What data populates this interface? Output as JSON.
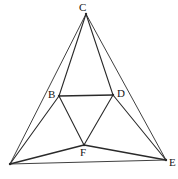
{
  "figure": {
    "type": "geometry-diagram",
    "background_color": "#ffffff",
    "stroke_color": "#2a2a2a",
    "label_color": "#151515",
    "canvas": {
      "width": 178,
      "height": 179
    },
    "points": [
      {
        "id": "A",
        "label": "",
        "x": 10,
        "y": 164,
        "label_x": 4,
        "label_y": 166,
        "faint": true
      },
      {
        "id": "B",
        "label": "B",
        "x": 59,
        "y": 96,
        "label_x": 48,
        "label_y": 89,
        "faint": false
      },
      {
        "id": "C",
        "label": "C",
        "x": 86,
        "y": 14,
        "label_x": 79,
        "label_y": 2,
        "faint": false
      },
      {
        "id": "D",
        "label": "D",
        "x": 113,
        "y": 95,
        "label_x": 117,
        "label_y": 88,
        "faint": false
      },
      {
        "id": "E",
        "label": "E",
        "x": 166,
        "y": 160,
        "label_x": 169,
        "label_y": 157,
        "faint": false
      },
      {
        "id": "F",
        "label": "F",
        "x": 84,
        "y": 145,
        "label_x": 80,
        "label_y": 147,
        "faint": false
      }
    ],
    "segments": [
      {
        "id": "seg-A-C",
        "from": "A",
        "to": "C",
        "width": 0.9
      },
      {
        "id": "seg-C-E",
        "from": "C",
        "to": "E",
        "width": 0.9
      },
      {
        "id": "seg-A-E",
        "from": "A",
        "to": "E",
        "width": 0.9
      },
      {
        "id": "seg-C-B",
        "from": "C",
        "to": "B",
        "width": 1.1
      },
      {
        "id": "seg-C-D",
        "from": "C",
        "to": "D",
        "width": 1.1
      },
      {
        "id": "seg-B-D",
        "from": "B",
        "to": "D",
        "width": 1.6
      },
      {
        "id": "seg-B-F",
        "from": "B",
        "to": "F",
        "width": 1.1
      },
      {
        "id": "seg-D-F",
        "from": "D",
        "to": "F",
        "width": 1.1
      },
      {
        "id": "seg-A-B",
        "from": "A",
        "to": "B",
        "width": 1.1
      },
      {
        "id": "seg-D-E",
        "from": "D",
        "to": "E",
        "width": 1.1
      },
      {
        "id": "seg-A-F",
        "from": "A",
        "to": "F",
        "width": 1.3
      },
      {
        "id": "seg-F-E",
        "from": "F",
        "to": "E",
        "width": 1.3
      }
    ]
  }
}
